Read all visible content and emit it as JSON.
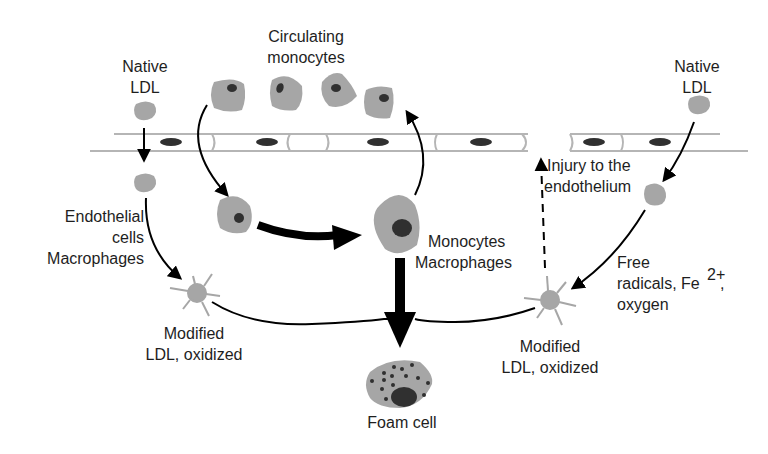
{
  "colors": {
    "cell_fill": "#a6a6a6",
    "nucleus": "#303030",
    "endothelium_stroke": "#b5b5b5",
    "arrow": "#000000",
    "text": "#1e1e1e"
  },
  "labels": {
    "native_ldl_left_1": "Native",
    "native_ldl_left_2": "LDL",
    "circulating_1": "Circulating",
    "circulating_2": "monocytes",
    "native_ldl_right_1": "Native",
    "native_ldl_right_2": "LDL",
    "endothelial_1": "Endothelial",
    "endothelial_2": "cells",
    "endothelial_3": "Macrophages",
    "injury_1": "Injury to the",
    "injury_2": "endothelium",
    "mono_mac_1": "Monocytes",
    "mono_mac_2": "Macrophages",
    "free_radicals_1": "Free",
    "free_radicals_2": "radicals, Fe",
    "free_radicals_sup": "2+",
    "free_radicals_comma": ",",
    "free_radicals_3": "oxygen",
    "modified_left_1": "Modified",
    "modified_left_2": "LDL, oxidized",
    "modified_right_1": "Modified",
    "modified_right_2": "LDL, oxidized",
    "foam_cell": "Foam cell"
  },
  "nodes": [
    {
      "id": "native-ldl-left",
      "label": "Native LDL"
    },
    {
      "id": "circulating-monocytes",
      "label": "Circulating monocytes",
      "count": 4
    },
    {
      "id": "native-ldl-right",
      "label": "Native LDL"
    },
    {
      "id": "endothelium",
      "label": "Endothelium"
    },
    {
      "id": "monocyte-entered",
      "label": "Monocyte"
    },
    {
      "id": "monocytes-macrophages",
      "label": "Monocytes Macrophages"
    },
    {
      "id": "modified-ldl-left",
      "label": "Modified LDL, oxidized"
    },
    {
      "id": "modified-ldl-right",
      "label": "Modified LDL, oxidized"
    },
    {
      "id": "foam-cell",
      "label": "Foam cell"
    }
  ],
  "edges": [
    {
      "from": "native-ldl-left",
      "to": "ldl-subendothelial-left",
      "style": "solid"
    },
    {
      "from": "ldl-subendothelial-left",
      "to": "modified-ldl-left",
      "label": "Endothelial cells Macrophages",
      "style": "solid"
    },
    {
      "from": "circulating-monocytes",
      "to": "monocyte-entered",
      "style": "solid"
    },
    {
      "from": "monocyte-entered",
      "to": "monocytes-macrophages",
      "style": "thick"
    },
    {
      "from": "monocytes-macrophages",
      "to": "circulating-monocytes",
      "style": "solid"
    },
    {
      "from": "monocytes-macrophages",
      "to": "foam-cell",
      "style": "thick"
    },
    {
      "from": "modified-ldl-left",
      "to": "foam-cell",
      "style": "solid"
    },
    {
      "from": "modified-ldl-right",
      "to": "foam-cell",
      "style": "solid"
    },
    {
      "from": "modified-ldl-right",
      "to": "endothelium",
      "label": "Injury to the endothelium",
      "style": "dashed"
    },
    {
      "from": "native-ldl-right",
      "to": "ldl-subendothelial-right",
      "style": "solid"
    },
    {
      "from": "ldl-subendothelial-right",
      "to": "modified-ldl-right",
      "label": "Free radicals, Fe2+, oxygen",
      "style": "solid"
    }
  ]
}
